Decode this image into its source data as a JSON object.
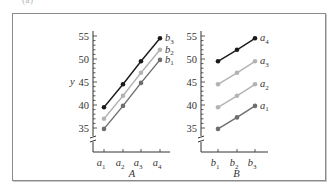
{
  "figure": {
    "panel_label": "(a)"
  },
  "chart_data": [
    {
      "type": "line",
      "title": "",
      "xlabel": "A",
      "ylabel": "y",
      "ylim": [
        33,
        56
      ],
      "yticks": [
        35,
        40,
        45,
        50,
        55
      ],
      "axis_break": true,
      "grid": false,
      "legend_position": "right-end labels",
      "categories": [
        "a1",
        "a2",
        "a3",
        "a4"
      ],
      "series": [
        {
          "name": "b3",
          "color": "#1a1a1a",
          "values": [
            39.5,
            44.5,
            49.5,
            54.5
          ]
        },
        {
          "name": "b2",
          "color": "#b3b3b3",
          "values": [
            37.0,
            42.0,
            47.0,
            52.0
          ]
        },
        {
          "name": "b1",
          "color": "#6e6e6e",
          "values": [
            34.8,
            39.8,
            44.8,
            49.8
          ]
        }
      ]
    },
    {
      "type": "line",
      "title": "",
      "xlabel": "B",
      "ylabel": "",
      "ylim": [
        33,
        56
      ],
      "yticks": [
        35,
        40,
        45,
        50,
        55
      ],
      "axis_break": true,
      "grid": false,
      "legend_position": "right-end labels",
      "categories": [
        "b1",
        "b2",
        "b3"
      ],
      "series": [
        {
          "name": "a4",
          "color": "#1a1a1a",
          "values": [
            49.5,
            52.0,
            54.5
          ]
        },
        {
          "name": "a3",
          "color": "#b3b3b3",
          "values": [
            44.5,
            47.0,
            49.5
          ]
        },
        {
          "name": "a2",
          "color": "#b3b3b3",
          "values": [
            39.5,
            42.0,
            44.5
          ]
        },
        {
          "name": "a1",
          "color": "#6e6e6e",
          "values": [
            34.8,
            37.3,
            39.8
          ]
        }
      ]
    }
  ]
}
